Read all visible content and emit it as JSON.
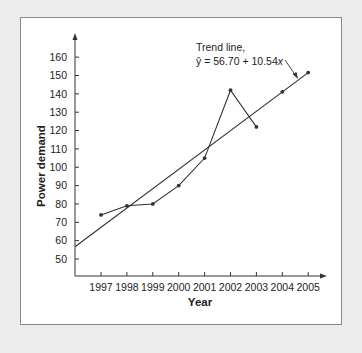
{
  "chart_data": {
    "type": "line",
    "title": "",
    "xlabel": "Year",
    "ylabel": "Power demand",
    "categories": [
      "1997",
      "1998",
      "1999",
      "2000",
      "2001",
      "2002",
      "2003",
      "2004",
      "2005"
    ],
    "yticks": [
      50,
      60,
      70,
      80,
      90,
      100,
      110,
      120,
      130,
      140,
      150,
      160
    ],
    "ylim": [
      42,
      170
    ],
    "grid": false,
    "legend": "none",
    "series": [
      {
        "name": "Actual demand",
        "x": [
          "1997",
          "1998",
          "1999",
          "2000",
          "2001",
          "2002",
          "2003"
        ],
        "values": [
          74,
          79,
          80,
          90,
          105,
          142,
          122
        ]
      },
      {
        "name": "Trend projections",
        "x": [
          "2004",
          "2005"
        ],
        "values": [
          141.08,
          151.62
        ]
      },
      {
        "name": "Trend line",
        "intercept": 56.7,
        "slope": 10.54,
        "x_start": 0,
        "x_end": 9
      }
    ],
    "annotations": [
      {
        "line1": "Trend line,",
        "line2": "ŷ = 56.70 + 10.54x"
      }
    ]
  },
  "labels": {
    "annot_line1": "Trend line,",
    "annot_eq_prefix": "ŷ = 56.70 + 10.54",
    "annot_eq_var": "x",
    "xlabel": "Year",
    "ylabel": "Power demand"
  }
}
